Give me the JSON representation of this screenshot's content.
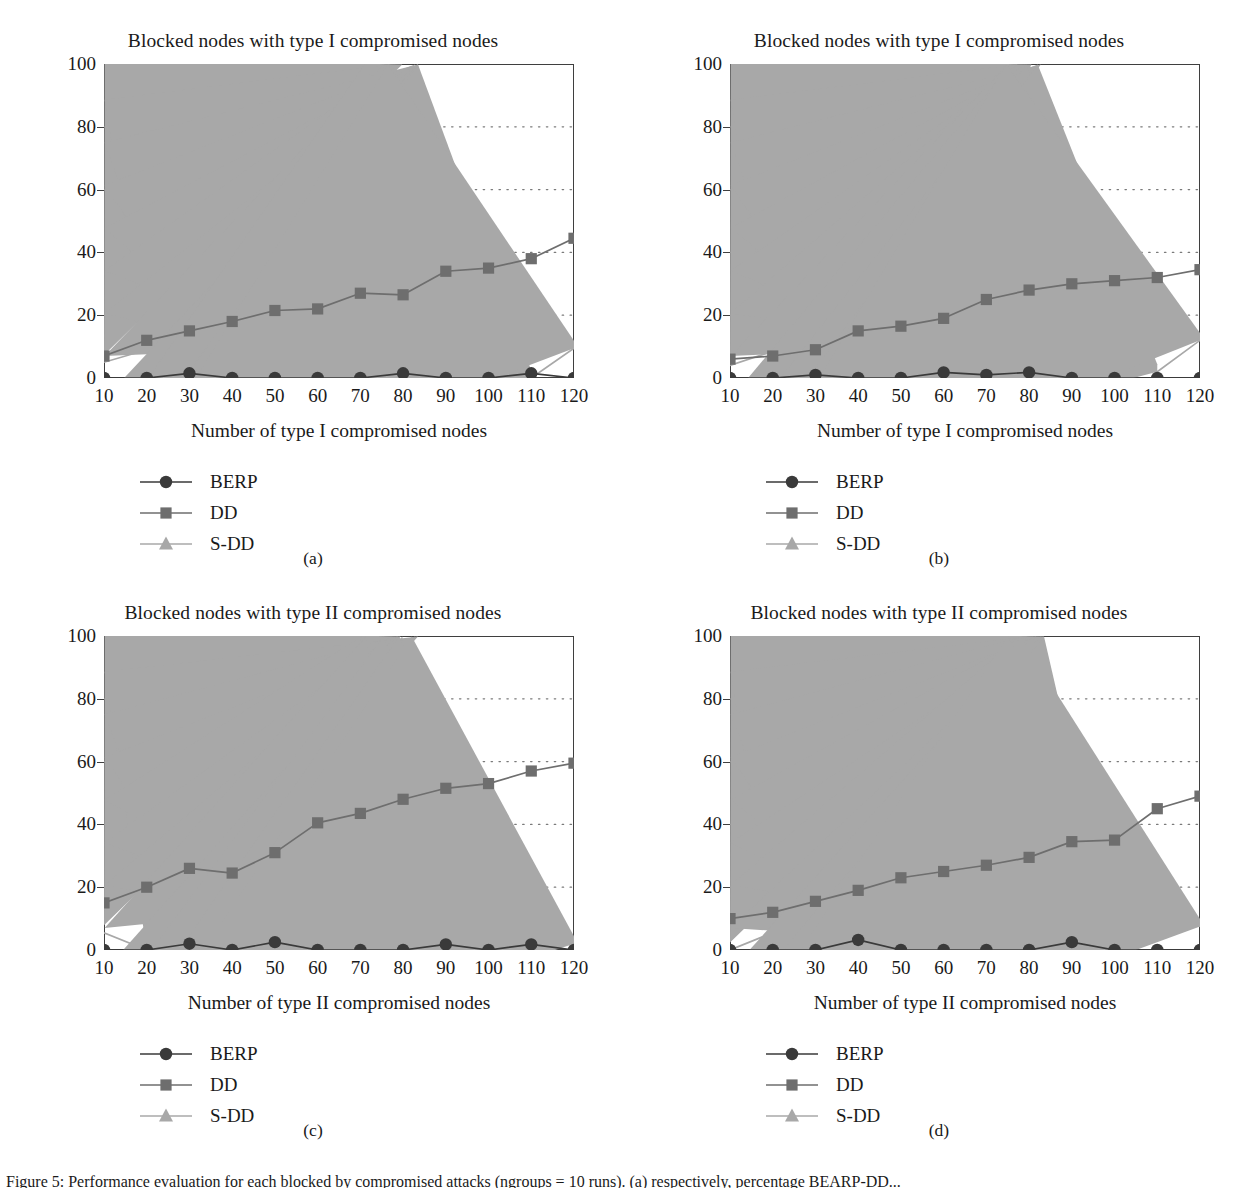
{
  "figure": {
    "caption": "Figure 5: Performance evaluation for each blocked by compromised attacks (ngroups = 10 runs). (a) respectively, percentage BEARP-DD...",
    "series_styles": {
      "BERP": {
        "color": "#3a3a3a",
        "marker": "circle"
      },
      "DD": {
        "color": "#6e6e6e",
        "marker": "square"
      },
      "S-DD": {
        "color": "#a8a8a8",
        "marker": "triangle"
      }
    },
    "axis_color": "#3f3f3f",
    "grid_color": "#7a7a7a"
  },
  "panels": [
    {
      "key": "a",
      "subcaption": "(a)",
      "legend": [
        "BERP",
        "DD",
        "S-DD"
      ],
      "chart_data": {
        "type": "line",
        "title": "Blocked nodes with type I compromised nodes",
        "xlabel": "Number of type I compromised nodes",
        "ylabel": "Blocked nodes (%)",
        "xlim": [
          10,
          120
        ],
        "ylim": [
          0,
          100
        ],
        "yticks": [
          0,
          20,
          40,
          60,
          80,
          100
        ],
        "grid": true,
        "legend_position": "below-left",
        "categories": [
          10,
          20,
          30,
          40,
          50,
          60,
          70,
          80,
          90,
          100,
          110,
          120
        ],
        "series": [
          {
            "name": "BERP",
            "values": [
              0,
              0,
              1.5,
              0,
              0,
              0,
              0,
              1.5,
              0,
              0,
              1.5,
              0
            ]
          },
          {
            "name": "DD",
            "values": [
              7,
              12,
              15,
              18,
              21.5,
              22,
              27,
              26.5,
              34,
              35,
              38,
              44.5
            ]
          },
          {
            "name": "S-DD",
            "values": [
              5,
              9,
              0,
              1,
              0,
              7.5,
              0,
              11,
              0,
              17,
              0,
              9.5
            ]
          }
        ]
      }
    },
    {
      "key": "b",
      "subcaption": "(b)",
      "legend": [
        "BERP",
        "DD",
        "S-DD"
      ],
      "chart_data": {
        "type": "line",
        "title": "Blocked nodes with type I compromised nodes",
        "xlabel": "Number of type I compromised nodes",
        "ylabel": "Blocked nodes (%)",
        "xlim": [
          10,
          120
        ],
        "ylim": [
          0,
          100
        ],
        "yticks": [
          0,
          20,
          40,
          60,
          80,
          100
        ],
        "grid": true,
        "legend_position": "below-left",
        "categories": [
          10,
          20,
          30,
          40,
          50,
          60,
          70,
          80,
          90,
          100,
          110,
          120
        ],
        "series": [
          {
            "name": "BERP",
            "values": [
              0,
              0,
              1,
              0,
              0,
              1.8,
              1,
              1.8,
              0,
              0,
              0,
              0
            ]
          },
          {
            "name": "DD",
            "values": [
              6,
              7,
              9,
              15,
              16.5,
              19,
              25,
              28,
              30,
              31,
              32,
              34.5
            ]
          },
          {
            "name": "S-DD",
            "values": [
              4,
              8.5,
              1,
              2,
              4,
              6,
              8.5,
              11.5,
              10.5,
              5.5,
              2,
              12
            ]
          }
        ]
      }
    },
    {
      "key": "c",
      "subcaption": "(c)",
      "legend": [
        "BERP",
        "DD",
        "S-DD"
      ],
      "chart_data": {
        "type": "line",
        "title": "Blocked nodes with type II compromised nodes",
        "xlabel": "Number of type II compromised nodes",
        "ylabel": "Blocked nodes (%)",
        "xlim": [
          10,
          120
        ],
        "ylim": [
          0,
          100
        ],
        "yticks": [
          0,
          20,
          40,
          60,
          80,
          100
        ],
        "grid": true,
        "legend_position": "below-left",
        "categories": [
          10,
          20,
          30,
          40,
          50,
          60,
          70,
          80,
          90,
          100,
          110,
          120
        ],
        "series": [
          {
            "name": "BERP",
            "values": [
              0,
              0,
              2,
              0,
              2.5,
              0,
              0,
              0,
              1.8,
              0,
              1.8,
              0
            ]
          },
          {
            "name": "DD",
            "values": [
              15,
              20,
              26,
              24.5,
              31,
              40.5,
              43.5,
              48,
              51.5,
              53,
              57,
              59.5
            ]
          },
          {
            "name": "S-DD",
            "values": [
              5.5,
              0,
              6.5,
              1,
              18,
              8.5,
              6.5,
              16.5,
              5,
              11,
              6,
              2
            ]
          }
        ]
      }
    },
    {
      "key": "d",
      "subcaption": "(d)",
      "legend": [
        "BERP",
        "DD",
        "S-DD"
      ],
      "chart_data": {
        "type": "line",
        "title": "Blocked nodes with type II compromised nodes",
        "xlabel": "Number of type II compromised nodes",
        "ylabel": "Blocked nodes (%)",
        "xlim": [
          10,
          120
        ],
        "ylim": [
          0,
          100
        ],
        "yticks": [
          0,
          20,
          40,
          60,
          80,
          100
        ],
        "grid": true,
        "legend_position": "below-left",
        "categories": [
          10,
          20,
          30,
          40,
          50,
          60,
          70,
          80,
          90,
          100,
          110,
          120
        ],
        "series": [
          {
            "name": "BERP",
            "values": [
              0,
              0,
              0,
              3.2,
              0,
              0,
              0,
              0,
              2.5,
              0,
              0,
              0
            ]
          },
          {
            "name": "DD",
            "values": [
              10,
              12,
              15.5,
              19,
              23,
              25,
              27,
              29.5,
              34.5,
              35,
              45,
              49
            ]
          },
          {
            "name": "S-DD",
            "values": [
              0,
              5.5,
              7,
              2.5,
              5.5,
              0,
              8,
              1,
              3.5,
              0,
              11.5,
              7.5
            ]
          }
        ]
      }
    }
  ]
}
